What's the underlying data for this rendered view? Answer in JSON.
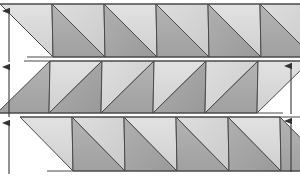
{
  "figure": {
    "canvas": {
      "width": 300,
      "height": 176,
      "background": "#ffffff"
    },
    "colors": {
      "light_fill": "#d9d9d9",
      "mid_fill": "#bdbdbd",
      "dark_fill": "#a8a8a8",
      "darker_fill": "#9a9a9a",
      "edge_stroke": "#4a4a4a",
      "arrow_color": "#3a3a3a",
      "background": "#ffffff"
    },
    "bands": [
      {
        "name": "band-top",
        "index": 1,
        "y_top": 4,
        "y_bottom": 57,
        "x_start": 0,
        "x_end": 284,
        "skew_offset": 27,
        "triangle_half_width": 26,
        "triangle_count": 11,
        "first_triangle_orientation": "down",
        "shade_sequence": [
          "light",
          "dark",
          "light",
          "dark",
          "light",
          "dark",
          "light",
          "dark",
          "light",
          "dark",
          "light"
        ]
      },
      {
        "name": "band-middle",
        "index": 2,
        "y_top": 61,
        "y_bottom": 113,
        "x_start": 24,
        "x_end": 279,
        "skew_offset": -27,
        "triangle_half_width": 26,
        "triangle_count": 10,
        "first_triangle_orientation": "up",
        "shade_sequence": [
          "dark",
          "light",
          "dark",
          "light",
          "dark",
          "light",
          "dark",
          "light",
          "dark",
          "light"
        ]
      },
      {
        "name": "band-bottom",
        "index": 3,
        "y_top": 117,
        "y_bottom": 171,
        "x_start": 20,
        "x_end": 285,
        "skew_offset": 27,
        "triangle_half_width": 26,
        "triangle_count": 10,
        "first_triangle_orientation": "down",
        "shade_sequence": [
          "light",
          "dark",
          "light",
          "dark",
          "light",
          "dark",
          "light",
          "dark",
          "light",
          "dark"
        ]
      }
    ],
    "arrows_left": [
      {
        "name": "height-arrow-left-1",
        "x": 9,
        "y_tail": 62,
        "y_head": 4,
        "direction": "up"
      },
      {
        "name": "height-arrow-left-2",
        "x": 9,
        "y_tail": 117,
        "y_head": 60,
        "direction": "up"
      },
      {
        "name": "height-arrow-left-3",
        "x": 9,
        "y_tail": 174,
        "y_head": 116,
        "direction": "up"
      }
    ],
    "arrows_right": [
      {
        "name": "height-arrow-right-1",
        "x": 291,
        "y_tail": 114,
        "y_head": 59,
        "direction": "up"
      },
      {
        "name": "height-arrow-right-2",
        "x": 291,
        "y_tail": 172,
        "y_head": 114,
        "direction": "up"
      }
    ]
  }
}
